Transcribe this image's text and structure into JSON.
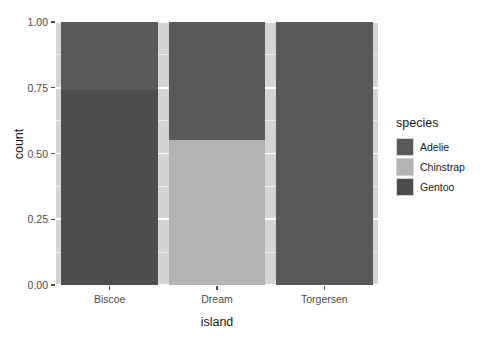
{
  "chart_data": {
    "type": "bar",
    "title": "",
    "subtitle": "",
    "xlabel": "island",
    "ylabel": "count",
    "categories": [
      "Biscoe",
      "Dream",
      "Torgersen"
    ],
    "x_tick_labels": [
      "Biscoe",
      "Dream",
      "Torgersen"
    ],
    "y_tick_labels": [
      "0.00",
      "0.25",
      "0.50",
      "0.75",
      "1.00"
    ],
    "y_tick_values": [
      0.0,
      0.25,
      0.5,
      0.75,
      1.0
    ],
    "ylim": [
      0,
      1
    ],
    "stacked": true,
    "position": "fill",
    "grid": true,
    "legend_position": "right",
    "legend_title": "species",
    "series": [
      {
        "name": "Adelie",
        "color": "#595959",
        "values": [
          0.26,
          0.45,
          1.0
        ]
      },
      {
        "name": "Chinstrap",
        "color": "#b3b3b3",
        "values": [
          0.0,
          0.55,
          0.0
        ]
      },
      {
        "name": "Gentoo",
        "color": "#4d4d4d",
        "values": [
          0.74,
          0.0,
          0.0
        ]
      }
    ],
    "stack_order_bottom_to_top": [
      "Gentoo",
      "Chinstrap",
      "Adelie"
    ],
    "panel_background": "#d4d4d4",
    "grid_major_color": "#ffffff",
    "grid_minor_color": "#ededed",
    "axis_text_color": "#4d4d4d",
    "axis_title_color": "#1a1a1a"
  },
  "legend": {
    "title": "species",
    "items": [
      {
        "label": "Adelie",
        "color": "#595959"
      },
      {
        "label": "Chinstrap",
        "color": "#b3b3b3"
      },
      {
        "label": "Gentoo",
        "color": "#4d4d4d"
      }
    ]
  },
  "axes": {
    "x_title": "island",
    "y_title": "count"
  },
  "artifact": {
    "text": ""
  }
}
